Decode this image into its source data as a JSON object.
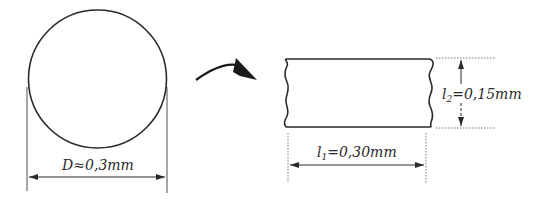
{
  "figure": {
    "left": {
      "shape": "circle",
      "dimension_label": "D≈0,3mm",
      "dimension_symbol": "D",
      "dimension_relation": "≈",
      "dimension_value": "0,3mm"
    },
    "transition": {
      "icon": "curved-arrow-right"
    },
    "right": {
      "shape": "flattened-rectangle-with-wavy-ends",
      "width_label": {
        "symbol": "l",
        "subscript": "1",
        "value": "=0,30mm"
      },
      "height_label": {
        "symbol": "l",
        "subscript": "2",
        "value": "=0,15mm"
      }
    }
  },
  "colors": {
    "stroke": "#2a2a2a",
    "background": "#ffffff"
  }
}
